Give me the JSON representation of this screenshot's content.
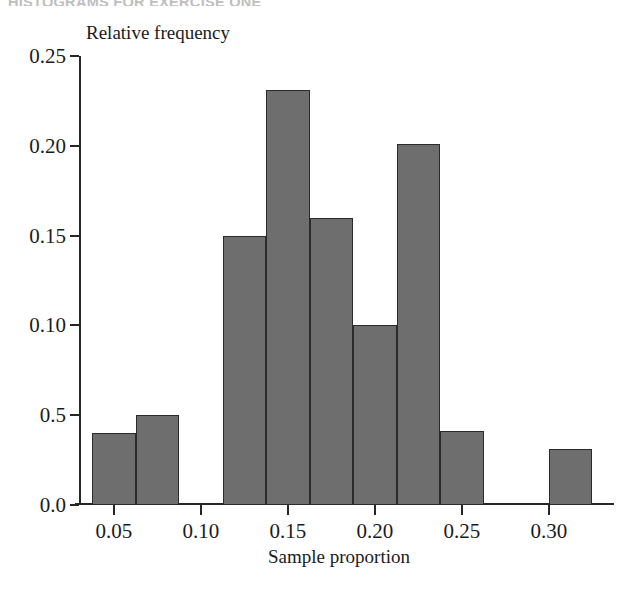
{
  "page": {
    "header_text": "HISTOGRAMS FOR EXERCISE ONE"
  },
  "chart_data": {
    "type": "bar",
    "title": "",
    "xlabel": "Sample proportion",
    "ylabel": "Relative frequency",
    "xlim": [
      0.03,
      0.3375
    ],
    "ylim": [
      0.0,
      0.25
    ],
    "grid": false,
    "legend": null,
    "bin_width": 0.025,
    "bar_color": "#6e6e6e",
    "bar_edge_color": "#2b2b2b",
    "axis_color": "#262626",
    "xticks": [
      0.05,
      0.1,
      0.15,
      0.2,
      0.25,
      0.3
    ],
    "xtick_labels": [
      "0.05",
      "0.10",
      "0.15",
      "0.20",
      "0.25",
      "0.30"
    ],
    "yticks": [
      0.0,
      0.05,
      0.1,
      0.15,
      0.2,
      0.25
    ],
    "ytick_labels": [
      "0.0",
      "0.5",
      "0.10",
      "0.15",
      "0.20",
      "0.25"
    ],
    "bins": [
      {
        "x0": 0.0375,
        "x1": 0.0625,
        "value": 0.04
      },
      {
        "x0": 0.0625,
        "x1": 0.0875,
        "value": 0.05
      },
      {
        "x0": 0.1125,
        "x1": 0.1375,
        "value": 0.15
      },
      {
        "x0": 0.1375,
        "x1": 0.1625,
        "value": 0.231
      },
      {
        "x0": 0.1625,
        "x1": 0.1875,
        "value": 0.16
      },
      {
        "x0": 0.1875,
        "x1": 0.2125,
        "value": 0.1
      },
      {
        "x0": 0.2125,
        "x1": 0.2375,
        "value": 0.201
      },
      {
        "x0": 0.2375,
        "x1": 0.2625,
        "value": 0.041
      },
      {
        "x0": 0.3,
        "x1": 0.325,
        "value": 0.031
      }
    ]
  }
}
